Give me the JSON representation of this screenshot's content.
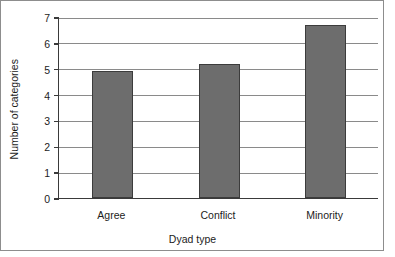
{
  "chart_data": {
    "type": "bar",
    "title": "",
    "subtitle": "",
    "categories": [
      "Agree",
      "Conflict",
      "Minority"
    ],
    "values": [
      4.9,
      5.2,
      6.7
    ],
    "xlabel": "Dyad type",
    "ylabel": "Number of categories",
    "ylim": [
      0,
      7
    ],
    "yticks": [
      0,
      1,
      2,
      3,
      4,
      5,
      6,
      7
    ],
    "ytick_labels": [
      "0",
      "1",
      "2",
      "3",
      "4",
      "5",
      "6",
      "7"
    ],
    "grid": "horizontal",
    "legend": "none",
    "bar_color": "#6d6d6d",
    "bar_edge_color": "#3c3c3c",
    "axis_color": "#3a3a3a",
    "gridline_color": "#8a8a8a",
    "frame_color": "#8d8d8d",
    "background": "#ffffff"
  }
}
